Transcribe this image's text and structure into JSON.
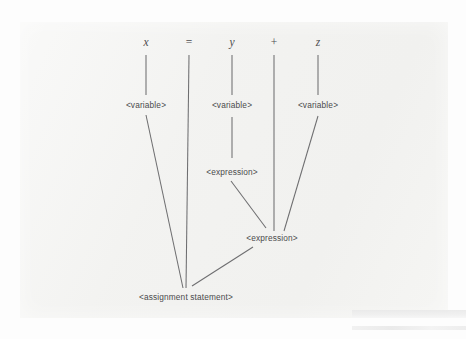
{
  "figure": {
    "type": "parse-tree",
    "background_color": "#f2f2f0",
    "line_color": "#6e6e70",
    "text_color": "#4a4a4c"
  },
  "terminals": [
    {
      "id": "t-x",
      "label": "x",
      "style": "italic",
      "x": 146,
      "y": 42
    },
    {
      "id": "t-eq",
      "label": "=",
      "style": "roman",
      "x": 189,
      "y": 42
    },
    {
      "id": "t-y",
      "label": "y",
      "style": "italic",
      "x": 232,
      "y": 42
    },
    {
      "id": "t-plus",
      "label": "+",
      "style": "roman",
      "x": 274,
      "y": 42
    },
    {
      "id": "t-z",
      "label": "z",
      "style": "italic",
      "x": 318,
      "y": 42
    }
  ],
  "nonterminals": [
    {
      "id": "n-var-x",
      "label": "<variable>",
      "x": 146,
      "y": 105
    },
    {
      "id": "n-var-y",
      "label": "<variable>",
      "x": 232,
      "y": 105
    },
    {
      "id": "n-var-z",
      "label": "<variable>",
      "x": 318,
      "y": 105
    },
    {
      "id": "n-expr-up",
      "label": "<expression>",
      "x": 232,
      "y": 172
    },
    {
      "id": "n-expr-low",
      "label": "<expression>",
      "x": 272,
      "y": 238
    },
    {
      "id": "n-assign",
      "label": "<assignment statement>",
      "x": 186,
      "y": 297
    }
  ],
  "edges": [
    {
      "id": "e-x-stub",
      "from": "t-x",
      "to": "n-var-x",
      "path": "M146,55 L146,95"
    },
    {
      "id": "e-y-stub",
      "from": "t-y",
      "to": "n-var-y",
      "path": "M232,55 L232,95"
    },
    {
      "id": "e-z-stub",
      "from": "t-z",
      "to": "n-var-z",
      "path": "M318,55 L318,95"
    },
    {
      "id": "e-eq-long",
      "from": "t-eq",
      "to": "n-assign",
      "path": "M189,55 L186,288"
    },
    {
      "id": "e-plus-long",
      "from": "t-plus",
      "to": "n-expr-low",
      "path": "M274,55 L274,231"
    },
    {
      "id": "e-varx-assign",
      "from": "n-var-x",
      "to": "n-assign",
      "path": "M146,115 L183,288"
    },
    {
      "id": "e-vary-expr",
      "from": "n-var-y",
      "to": "n-expr-up",
      "path": "M232,117 L232,158"
    },
    {
      "id": "e-varz-expr",
      "from": "n-var-z",
      "to": "n-expr-low",
      "path": "M318,116 L284,231"
    },
    {
      "id": "e-expr-expr",
      "from": "n-expr-up",
      "to": "n-expr-low",
      "path": "M231,181 L266,228"
    },
    {
      "id": "e-expr-assign",
      "from": "n-expr-low",
      "to": "n-assign",
      "path": "M253,247 L192,286"
    }
  ]
}
